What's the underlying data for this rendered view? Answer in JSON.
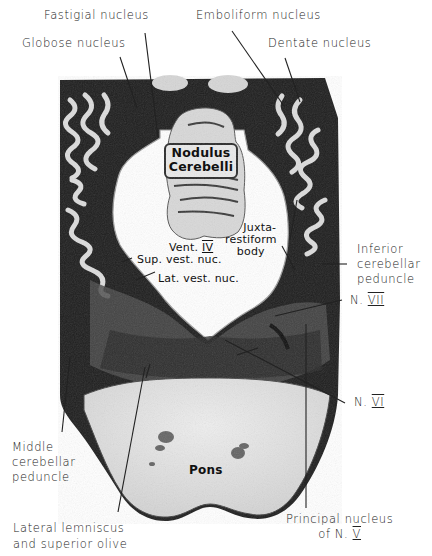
{
  "figure": {
    "type": "anatomical section (cerebellum and pons)",
    "colors": {
      "background": "#ffffff",
      "tissue_dark": "#1c1c1c",
      "tissue_mid": "#4a4a4a",
      "tissue_light": "#d9d9d9",
      "pons": "#e4e4e4",
      "ventricle": "#ffffff",
      "leader_line": "#222222"
    }
  },
  "labels": {
    "fastigial": "Fastigial nucleus",
    "emboliform": "Emboliform nucleus",
    "globose": "Globose nucleus",
    "dentate": "Dentate nucleus",
    "inferior_cerebellar_1": "Inferior",
    "inferior_cerebellar_2": "cerebellar",
    "inferior_cerebellar_3": "peduncle",
    "n7_prefix": "N.",
    "n7_numeral": "VII",
    "n6_prefix": "N.",
    "n6_numeral": "VI",
    "middle_cerebellar_1": "Middle",
    "middle_cerebellar_2": "cerebellar",
    "middle_cerebellar_3": "peduncle",
    "lateral_lemniscus_1": "Lateral lemniscus",
    "lateral_lemniscus_2": "and superior olive",
    "principal_v_1": "Principal nucleus",
    "principal_v_2_prefix": "of N.",
    "principal_v_2_numeral": "V"
  },
  "inner_labels": {
    "nodulus_1": "Nodulus",
    "nodulus_2": "Cerebelli",
    "vent_prefix": "Vent.",
    "vent_numeral": "IV",
    "juxta_1": "Juxta-",
    "juxta_2": "restiform",
    "juxta_3": "body",
    "sup_vest": "Sup. vest. nuc.",
    "lat_vest": "Lat. vest. nuc.",
    "pons": "Pons"
  }
}
